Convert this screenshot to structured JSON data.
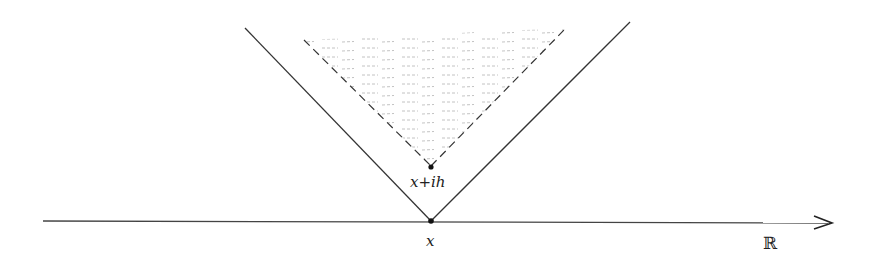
{
  "diagram": {
    "labels": {
      "vertex_point": "x",
      "shifted_point": "x+ih",
      "axis": "ℝ"
    },
    "colors": {
      "line": "#333333",
      "shade": "#9a9a9a"
    },
    "elements": [
      "real-axis-arrow",
      "outer-cone-solid",
      "inner-cone-dashed",
      "shaded-region"
    ]
  }
}
